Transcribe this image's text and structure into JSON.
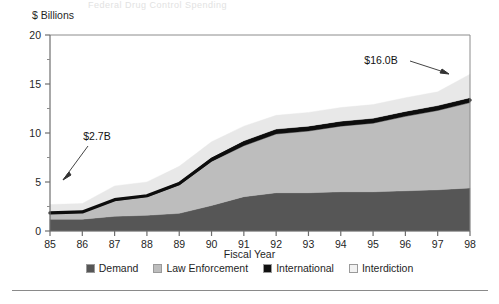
{
  "figure": {
    "ghost_top_text": "Federal Drug Control Spending",
    "y_axis_unit_label": "$ Billions",
    "x_axis_title": "Fiscal Year"
  },
  "legend": {
    "position": "bottom-center",
    "entries": [
      {
        "label": "Demand",
        "color": "#565656",
        "name": "demand"
      },
      {
        "label": "Law Enforcement",
        "color": "#bdbdbd",
        "name": "law-enforcement"
      },
      {
        "label": "International",
        "color": "#111111",
        "name": "international"
      },
      {
        "label": "Interdiction",
        "color": "#e8e8e8",
        "name": "interdiction"
      }
    ]
  },
  "annotations": [
    {
      "text": "$2.7B",
      "name": "annotation-start-total"
    },
    {
      "text": "$16.0B",
      "name": "annotation-end-total"
    }
  ],
  "colors": {
    "demand": "#565656",
    "law_enforcement": "#bdbdbd",
    "international": "#111111",
    "interdiction": "#e8e8e8",
    "axis": "#6e6e6e",
    "text": "#1f1f1f"
  },
  "chart_data": {
    "type": "area",
    "stacked": true,
    "title": "",
    "subtitle": "",
    "xlabel": "Fiscal Year",
    "ylabel": "$ Billions",
    "ylim": [
      0,
      20
    ],
    "xlim": [
      85,
      98
    ],
    "grid": false,
    "legend_position": "bottom",
    "y_major_ticks": [
      0,
      5,
      10,
      15,
      20
    ],
    "y_minor_ticks": [
      2.5,
      7.5,
      12.5,
      17.5
    ],
    "y_tick_labels": [
      "0",
      "5",
      "10",
      "15",
      "20"
    ],
    "categories": [
      "85",
      "86",
      "87",
      "88",
      "89",
      "90",
      "91",
      "92",
      "93",
      "94",
      "95",
      "96",
      "97",
      "98"
    ],
    "x_tick_labels": [
      "85",
      "86",
      "87",
      "88",
      "89",
      "90",
      "91",
      "92",
      "93",
      "94",
      "95",
      "96",
      "97",
      "98"
    ],
    "series": [
      {
        "name": "Demand",
        "color": "#565656",
        "values": [
          1.2,
          1.2,
          1.5,
          1.6,
          1.8,
          2.6,
          3.5,
          3.9,
          3.9,
          4.0,
          4.0,
          4.1,
          4.2,
          4.4
        ]
      },
      {
        "name": "Law Enforcement",
        "color": "#bdbdbd",
        "values": [
          0.6,
          0.7,
          1.6,
          1.9,
          2.9,
          4.5,
          5.2,
          6.0,
          6.3,
          6.7,
          7.0,
          7.6,
          8.1,
          8.7
        ]
      },
      {
        "name": "International",
        "color": "#111111",
        "values": [
          0.1,
          0.1,
          0.2,
          0.2,
          0.3,
          0.4,
          0.5,
          0.5,
          0.5,
          0.5,
          0.5,
          0.5,
          0.5,
          0.5
        ]
      },
      {
        "name": "Interdiction",
        "color": "#e8e8e8",
        "values": [
          0.8,
          0.8,
          1.3,
          1.3,
          1.6,
          1.6,
          1.5,
          1.4,
          1.4,
          1.4,
          1.4,
          1.4,
          1.4,
          2.4
        ]
      }
    ],
    "totals": [
      2.7,
      2.8,
      4.6,
      5.0,
      6.6,
      9.1,
      10.7,
      11.8,
      12.1,
      12.6,
      12.9,
      13.6,
      14.2,
      16.0
    ],
    "annotations": [
      {
        "text": "$2.7B",
        "x": "85",
        "y": 2.7
      },
      {
        "text": "$16.0B",
        "x": "98",
        "y": 16.0
      }
    ]
  }
}
